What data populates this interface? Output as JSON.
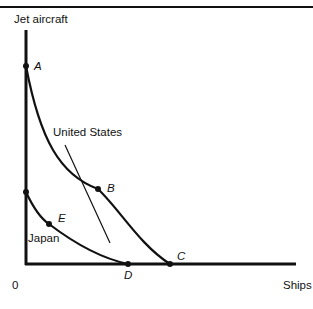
{
  "diagram": {
    "type": "production possibility frontiers",
    "y_axis_label": "Jet aircraft",
    "x_axis_label": "Ships",
    "origin_label": "0",
    "curves": [
      {
        "name": "United States",
        "label": "United States",
        "endpoints": [
          "A",
          "C"
        ]
      },
      {
        "name": "Japan",
        "label": "Japan",
        "endpoints": [
          "Japan y-intercept",
          "D"
        ]
      }
    ],
    "points": {
      "A": "A",
      "B": "B",
      "C": "C",
      "D": "D",
      "E": "E"
    },
    "tangent_line_at": "B"
  },
  "colors": {
    "ink": "#111111",
    "background": "#ffffff"
  }
}
